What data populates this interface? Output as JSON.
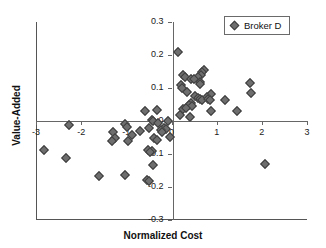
{
  "chart_data": {
    "type": "scatter",
    "title": "",
    "xlabel": "Normalized Cost",
    "ylabel": "Value-Added",
    "xlim": [
      -3,
      3
    ],
    "ylim": [
      -0.3,
      0.3
    ],
    "xticks": [
      -3,
      -2,
      -1,
      0,
      1,
      2,
      3
    ],
    "xtick_labels": [
      "-3",
      "-2",
      "-1",
      "0",
      "1",
      "2",
      "3"
    ],
    "yticks": [
      0.3,
      0.2,
      0.1,
      0,
      -0.1,
      -0.2,
      -0.3
    ],
    "ytick_labels": [
      "0.3",
      "0.2",
      "0.1",
      "0",
      "-0.1",
      "-0.2",
      "-0.3"
    ],
    "grid": false,
    "legend_position": "top-right",
    "marker": "diamond",
    "marker_color": "#6e6e6e",
    "marker_edge_color": "#3d3d3d",
    "series": [
      {
        "name": "Broker D",
        "points": [
          [
            0.14,
            0.208
          ],
          [
            0.26,
            0.138
          ],
          [
            0.3,
            0.133
          ],
          [
            0.72,
            0.156
          ],
          [
            0.68,
            0.148
          ],
          [
            0.66,
            0.14
          ],
          [
            0.58,
            0.133
          ],
          [
            0.44,
            0.128
          ],
          [
            0.5,
            0.126
          ],
          [
            0.62,
            0.118
          ],
          [
            0.22,
            0.11
          ],
          [
            0.64,
            0.113
          ],
          [
            1.73,
            0.114
          ],
          [
            0.24,
            0.1
          ],
          [
            1.75,
            0.086
          ],
          [
            0.34,
            0.088
          ],
          [
            0.52,
            0.077
          ],
          [
            0.88,
            0.083
          ],
          [
            0.78,
            0.074
          ],
          [
            0.58,
            0.07
          ],
          [
            0.62,
            0.066
          ],
          [
            0.68,
            0.064
          ],
          [
            0.8,
            0.066
          ],
          [
            0.86,
            0.065
          ],
          [
            1.18,
            0.063
          ],
          [
            0.44,
            0.055
          ],
          [
            0.38,
            0.047
          ],
          [
            0.46,
            0.044
          ],
          [
            0.26,
            0.036
          ],
          [
            0.32,
            0.038
          ],
          [
            -0.58,
            0.03
          ],
          [
            -0.32,
            0.032
          ],
          [
            0.88,
            0.031
          ],
          [
            1.46,
            0.03
          ],
          [
            0.18,
            0.019
          ],
          [
            0.4,
            0.013
          ],
          [
            -0.44,
            0.004
          ],
          [
            -0.4,
            0.001
          ],
          [
            -0.08,
            0.0
          ],
          [
            -0.3,
            -0.007
          ],
          [
            -1.02,
            -0.01
          ],
          [
            -2.28,
            -0.013
          ],
          [
            -0.98,
            -0.018
          ],
          [
            -0.5,
            -0.02
          ],
          [
            -0.16,
            -0.022
          ],
          [
            -0.12,
            -0.024
          ],
          [
            -1.3,
            -0.033
          ],
          [
            -0.7,
            -0.03
          ],
          [
            -0.24,
            -0.028
          ],
          [
            -0.2,
            -0.032
          ],
          [
            -0.88,
            -0.042
          ],
          [
            -1.24,
            -0.05
          ],
          [
            -0.04,
            -0.048
          ],
          [
            -0.38,
            -0.052
          ],
          [
            -0.32,
            -0.057
          ],
          [
            -1.32,
            -0.062
          ],
          [
            -0.96,
            -0.06
          ],
          [
            -0.52,
            -0.088
          ],
          [
            -0.44,
            -0.09
          ],
          [
            -2.82,
            -0.088
          ],
          [
            -0.48,
            -0.095
          ],
          [
            -2.34,
            -0.113
          ],
          [
            -0.4,
            -0.133
          ],
          [
            2.07,
            -0.131
          ],
          [
            -1.6,
            -0.167
          ],
          [
            -1.02,
            -0.165
          ],
          [
            -0.54,
            -0.178
          ],
          [
            -0.5,
            -0.182
          ]
        ]
      }
    ]
  },
  "legend": {
    "label": "Broker D"
  }
}
